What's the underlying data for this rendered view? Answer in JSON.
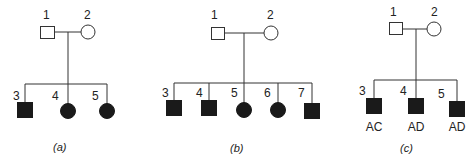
{
  "figure": {
    "panels": [
      {
        "caption": "(a)",
        "parents": [
          {
            "id": "1",
            "sex": "male",
            "affected": false
          },
          {
            "id": "2",
            "sex": "female",
            "affected": false
          }
        ],
        "children": [
          {
            "id": "3",
            "sex": "male",
            "affected": true
          },
          {
            "id": "4",
            "sex": "female",
            "affected": true
          },
          {
            "id": "5",
            "sex": "female",
            "affected": true
          }
        ]
      },
      {
        "caption": "(b)",
        "parents": [
          {
            "id": "1",
            "sex": "male",
            "affected": false
          },
          {
            "id": "2",
            "sex": "female",
            "affected": false
          }
        ],
        "children": [
          {
            "id": "3",
            "sex": "male",
            "affected": true
          },
          {
            "id": "4",
            "sex": "male",
            "affected": true
          },
          {
            "id": "5",
            "sex": "female",
            "affected": true
          },
          {
            "id": "6",
            "sex": "female",
            "affected": true
          },
          {
            "id": "7",
            "sex": "male",
            "affected": true
          }
        ]
      },
      {
        "caption": "(c)",
        "parents": [
          {
            "id": "1",
            "sex": "male",
            "affected": false
          },
          {
            "id": "2",
            "sex": "female",
            "affected": false
          }
        ],
        "children": [
          {
            "id": "3",
            "sex": "male",
            "affected": true,
            "genotype": "AC"
          },
          {
            "id": "4",
            "sex": "male",
            "affected": true,
            "genotype": "AD"
          },
          {
            "id": "5",
            "sex": "male",
            "affected": true,
            "genotype": "AD"
          }
        ]
      }
    ],
    "colors": {
      "affected": "#1a1a1a",
      "unaffected": "#ffffff",
      "line": "#333333"
    }
  }
}
